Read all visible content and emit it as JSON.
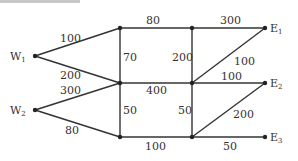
{
  "diagram": {
    "nodes": [
      {
        "id": "W1",
        "label": "W",
        "sub": "1",
        "x": 35,
        "y": 56
      },
      {
        "id": "W2",
        "label": "W",
        "sub": "2",
        "x": 35,
        "y": 110
      },
      {
        "id": "A",
        "label": "",
        "sub": "",
        "x": 120,
        "y": 28
      },
      {
        "id": "B",
        "label": "",
        "sub": "",
        "x": 192,
        "y": 28
      },
      {
        "id": "E1",
        "label": "E",
        "sub": "1",
        "x": 265,
        "y": 28
      },
      {
        "id": "C",
        "label": "",
        "sub": "",
        "x": 120,
        "y": 83
      },
      {
        "id": "D",
        "label": "",
        "sub": "",
        "x": 192,
        "y": 83
      },
      {
        "id": "E2",
        "label": "E",
        "sub": "2",
        "x": 265,
        "y": 83
      },
      {
        "id": "F",
        "label": "",
        "sub": "",
        "x": 120,
        "y": 137
      },
      {
        "id": "G",
        "label": "",
        "sub": "",
        "x": 192,
        "y": 137
      },
      {
        "id": "E3",
        "label": "E",
        "sub": "3",
        "x": 265,
        "y": 137
      }
    ],
    "edges": [
      {
        "from": "W1",
        "to": "A",
        "weight": "100"
      },
      {
        "from": "W1",
        "to": "C",
        "weight": "200"
      },
      {
        "from": "W2",
        "to": "C",
        "weight": "300"
      },
      {
        "from": "W2",
        "to": "F",
        "weight": "80"
      },
      {
        "from": "A",
        "to": "B",
        "weight": "80"
      },
      {
        "from": "B",
        "to": "E1",
        "weight": "300"
      },
      {
        "from": "A",
        "to": "C",
        "weight": "70"
      },
      {
        "from": "B",
        "to": "D",
        "weight": "200"
      },
      {
        "from": "D",
        "to": "E1",
        "weight": "100"
      },
      {
        "from": "C",
        "to": "D",
        "weight": "400"
      },
      {
        "from": "D",
        "to": "E2",
        "weight": "100"
      },
      {
        "from": "C",
        "to": "F",
        "weight": "50"
      },
      {
        "from": "D",
        "to": "G",
        "weight": "50"
      },
      {
        "from": "G",
        "to": "E2",
        "weight": "200"
      },
      {
        "from": "F",
        "to": "G",
        "weight": "100"
      },
      {
        "from": "G",
        "to": "E3",
        "weight": "50"
      }
    ]
  },
  "labels": {
    "w1": "W",
    "w1_sub": "1",
    "w2": "W",
    "w2_sub": "2",
    "e1": "E",
    "e1_sub": "1",
    "e2": "E",
    "e2_sub": "2",
    "e3": "E",
    "e3_sub": "3",
    "w1_a": "100",
    "w1_c": "200",
    "w2_c": "300",
    "w2_f": "80",
    "a_b": "80",
    "b_e1": "300",
    "a_c": "70",
    "b_d": "200",
    "d_e1": "100",
    "c_d": "400",
    "d_e2": "100",
    "c_f": "50",
    "d_g": "50",
    "g_e2": "200",
    "f_g": "100",
    "g_e3": "50"
  }
}
